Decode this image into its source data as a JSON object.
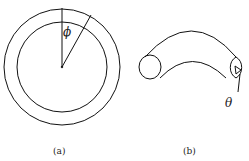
{
  "figure": {
    "panels": [
      {
        "id": "a",
        "caption": "(a)",
        "description": "Two concentric circles with a radial vertical line and an angled radial line",
        "angle_symbol": "ϕ"
      },
      {
        "id": "b",
        "caption": "(b)",
        "description": "Curved tube (section of torus) with circular cross-sections at both ends",
        "angle_symbol": "θ"
      }
    ],
    "colors": {
      "stroke": "#111111",
      "background": "#ffffff"
    }
  }
}
